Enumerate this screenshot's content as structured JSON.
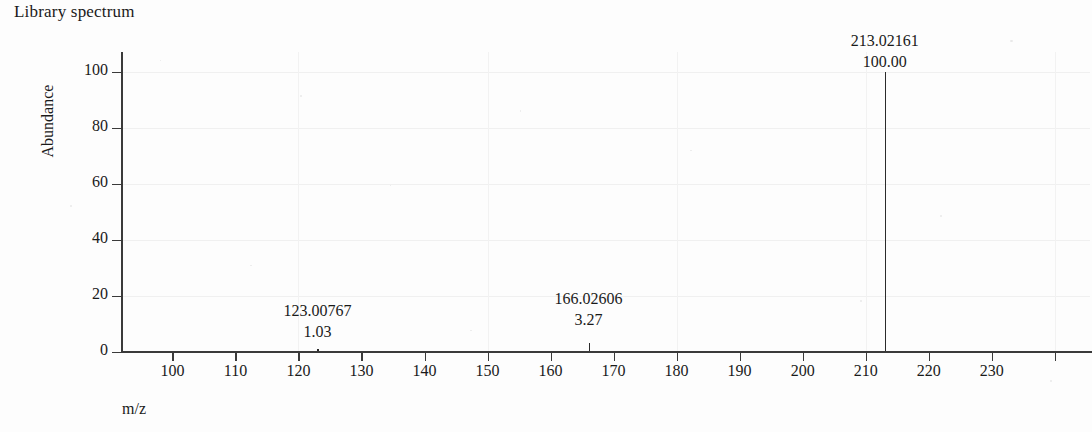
{
  "title": "Library spectrum",
  "axes": {
    "ylabel": "Abundance",
    "xlabel": "m/z"
  },
  "chart_data": {
    "type": "bar",
    "title": "Library spectrum",
    "xlabel": "m/z",
    "ylabel": "Abundance",
    "xlim": [
      92.0,
      245.6
    ],
    "ylim": [
      0,
      100
    ],
    "grid": true,
    "legend": "none",
    "x_ticks": [
      100,
      110,
      120,
      130,
      140,
      150,
      160,
      170,
      180,
      190,
      200,
      210,
      220,
      230,
      240
    ],
    "x_tick_labels": [
      "100",
      "110",
      "120",
      "130",
      "140",
      "150",
      "160",
      "170",
      "180",
      "190",
      "200",
      "210",
      "220",
      "230",
      ""
    ],
    "y_ticks": [
      0,
      20,
      40,
      60,
      80,
      100
    ],
    "y_tick_labels": [
      "0",
      "20",
      "40",
      "60",
      "80",
      "100"
    ],
    "x": [
      123.00767,
      166.02606,
      213.02161
    ],
    "values": [
      1.03,
      3.27,
      100.0
    ],
    "peaks": [
      {
        "mz": "123.00767",
        "abundance": "1.03",
        "mz_value": 123.00767,
        "abundance_value": 1.03
      },
      {
        "mz": "166.02606",
        "abundance": "3.27",
        "mz_value": 166.02606,
        "abundance_value": 3.27
      },
      {
        "mz": "213.02161",
        "abundance": "100.00",
        "mz_value": 213.02161,
        "abundance_value": 100.0
      }
    ]
  },
  "colors": {
    "peak": "#2b2b2b",
    "axis": "#3a3a3a",
    "grid": "#f0f0f0",
    "text": "#1a1a1a",
    "background": "#fdfdfd"
  }
}
